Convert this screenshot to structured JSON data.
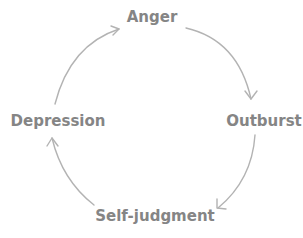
{
  "diagram": {
    "type": "cycle",
    "nodes": [
      {
        "id": "anger",
        "label": "Anger"
      },
      {
        "id": "outburst",
        "label": "Outburst"
      },
      {
        "id": "self_judgment",
        "label": "Self-judgment"
      },
      {
        "id": "depression",
        "label": "Depression"
      }
    ],
    "edges": [
      {
        "from": "Anger",
        "to": "Outburst"
      },
      {
        "from": "Outburst",
        "to": "Self-judgment"
      },
      {
        "from": "Self-judgment",
        "to": "Depression"
      },
      {
        "from": "Depression",
        "to": "Anger"
      }
    ],
    "colors": {
      "text": "#858585",
      "arrow": "#b3b3b3",
      "background": "#ffffff"
    }
  }
}
